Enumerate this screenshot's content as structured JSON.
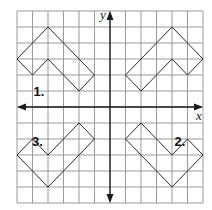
{
  "diagram": {
    "grid": {
      "xmin": -6,
      "xmax": 6,
      "ymin": -6,
      "ymax": 6,
      "step": 1
    },
    "axes": {
      "x_label": "x",
      "y_label": "y"
    },
    "colors": {
      "grid": "#9a9a9a",
      "axis": "#1a1a1a",
      "shape": "#2b2b2b",
      "label": "#111111"
    },
    "shapes": [
      {
        "id": "original",
        "label": "",
        "vertices": [
          [
            4,
            5
          ],
          [
            6,
            3
          ],
          [
            5,
            2
          ],
          [
            4,
            3
          ],
          [
            2,
            1
          ],
          [
            1,
            2
          ]
        ]
      },
      {
        "id": "1",
        "label": "1.",
        "vertices": [
          [
            -4,
            5
          ],
          [
            -1,
            2
          ],
          [
            -2,
            1
          ],
          [
            -4,
            3
          ],
          [
            -5,
            2
          ],
          [
            -6,
            3
          ]
        ],
        "label_pos": [
          -5,
          1.3
        ]
      },
      {
        "id": "2",
        "label": "2.",
        "vertices": [
          [
            2,
            -1
          ],
          [
            1,
            -2
          ],
          [
            4,
            -5
          ],
          [
            6,
            -3
          ],
          [
            5,
            -2
          ],
          [
            4,
            -3
          ]
        ],
        "label_pos": [
          4.1,
          -1.8
        ]
      },
      {
        "id": "3",
        "label": "3.",
        "vertices": [
          [
            -2,
            -1
          ],
          [
            -1,
            -2
          ],
          [
            -4,
            -5
          ],
          [
            -6,
            -3
          ],
          [
            -5,
            -2
          ],
          [
            -4,
            -3
          ]
        ],
        "label_pos": [
          -5.1,
          -1.8
        ]
      }
    ]
  }
}
